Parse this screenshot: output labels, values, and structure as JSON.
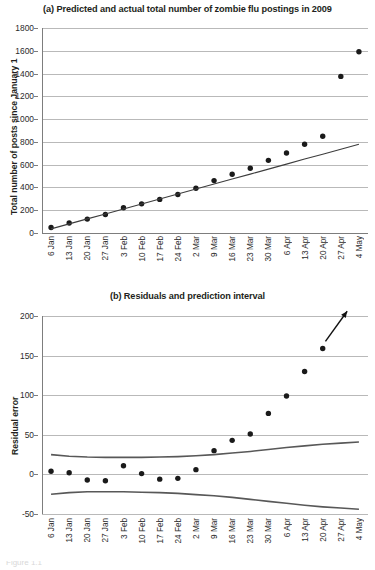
{
  "figure": {
    "caption_fragment": "Figure 1.1"
  },
  "chart_data": [
    {
      "id": "panel-a",
      "type": "scatter",
      "title": "(a) Predicted and actual total number of zombie flu postings in 2009",
      "xlabel": "",
      "ylabel": "Total number of posts since January 1",
      "ylim": [
        0,
        1800
      ],
      "yticks": [
        0,
        200,
        400,
        600,
        800,
        1000,
        1200,
        1400,
        1600,
        1800
      ],
      "grid": true,
      "legend": "none",
      "categories": [
        "6 Jan",
        "13 Jan",
        "20 Jan",
        "27 Jan",
        "3 Feb",
        "10 Feb",
        "17 Feb",
        "24 Feb",
        "2 Mar",
        "9 Mar",
        "16 Mar",
        "23 Mar",
        "30 Mar",
        "6 Apr",
        "13 Apr",
        "20 Apr",
        "27 Apr",
        "4 May"
      ],
      "series": [
        {
          "name": "Actual total posts",
          "kind": "points",
          "color": "#1a1a1a",
          "values": [
            48,
            88,
            122,
            162,
            222,
            256,
            295,
            338,
            393,
            460,
            516,
            568,
            638,
            703,
            779,
            849,
            1375,
            1592
          ]
        },
        {
          "name": "Predicted (linear fit)",
          "kind": "line",
          "color": "#3d3d3d",
          "values": [
            36,
            80,
            124,
            167,
            211,
            255,
            299,
            342,
            386,
            430,
            474,
            517,
            561,
            605,
            649,
            692,
            736,
            780
          ]
        }
      ]
    },
    {
      "id": "panel-b",
      "type": "scatter",
      "title": "(b) Residuals and prediction interval",
      "xlabel": "",
      "ylabel": "Residual error",
      "ylim": [
        -50,
        200
      ],
      "yticks": [
        -50,
        0,
        50,
        100,
        150,
        200
      ],
      "grid": true,
      "legend": "none",
      "categories": [
        "6 Jan",
        "13 Jan",
        "20 Jan",
        "27 Jan",
        "3 Feb",
        "10 Feb",
        "17 Feb",
        "24 Feb",
        "2 Mar",
        "9 Mar",
        "16 Mar",
        "23 Mar",
        "30 Mar",
        "6 Apr",
        "13 Apr",
        "20 Apr",
        "27 Apr",
        "4 May"
      ],
      "series": [
        {
          "name": "Residual error",
          "kind": "points",
          "color": "#1a1a1a",
          "values": [
            4,
            2,
            -7,
            -8,
            11,
            1,
            -6,
            -5,
            6,
            30,
            43,
            51,
            77,
            99,
            130,
            159,
            null,
            null
          ]
        },
        {
          "name": "Upper prediction interval",
          "kind": "line",
          "color": "#585858",
          "values": [
            25,
            23,
            22,
            21.5,
            21.5,
            21.5,
            22,
            22.5,
            23.5,
            25,
            27,
            29,
            31.5,
            34,
            36,
            38,
            39.5,
            41
          ]
        },
        {
          "name": "Lower prediction interval",
          "kind": "line",
          "color": "#585858",
          "values": [
            -25,
            -23,
            -22,
            -22,
            -22,
            -22.5,
            -23,
            -24,
            -25.5,
            -27,
            -29,
            -31.5,
            -34,
            -36.5,
            -39,
            -41,
            -42.5,
            -44
          ]
        }
      ],
      "annotations": [
        {
          "name": "trend-arrow",
          "kind": "arrow",
          "from": {
            "x": 15.15,
            "y": 168
          },
          "to": {
            "x": 16.35,
            "y": 206
          }
        }
      ]
    }
  ]
}
